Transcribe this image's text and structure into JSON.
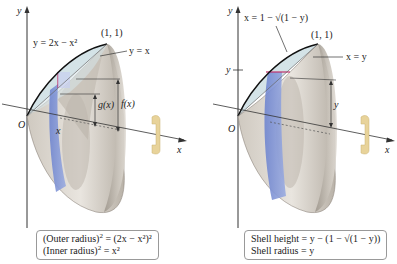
{
  "left_panel": {
    "axis_y": "y",
    "axis_x": "x",
    "origin": "O",
    "curve_label": "y = 2x − x²",
    "line_label": "y = x",
    "point_label": "(1, 1)",
    "g_label": "g(x)",
    "f_label": "f(x)",
    "x_marker": "x",
    "caption": {
      "line1_prefix": "(Outer radius)",
      "line1_suffix": " = (2x − x²)²",
      "line2_prefix": "(Inner radius)",
      "line2_suffix": " = x²"
    }
  },
  "right_panel": {
    "axis_y": "y",
    "axis_x": "x",
    "origin": "O",
    "curve_label": "x = 1 − √(1 − y)",
    "line_label": "x = y",
    "point_label": "(1, 1)",
    "y_tick_label": "y",
    "height_label": "y",
    "caption": {
      "line1": "Shell height = y − (1 − √(1 − y))",
      "line2": "Shell radius = y"
    }
  },
  "colors": {
    "solid_surface": "#d9d4cc",
    "solid_shadow": "#a9a39a",
    "region_fill": "#cfe0e4",
    "shell_blue": "#7f93d6",
    "curve": "#111111",
    "rotation_arrow": "#e8d39a",
    "highlight_line": "#c0306a"
  }
}
